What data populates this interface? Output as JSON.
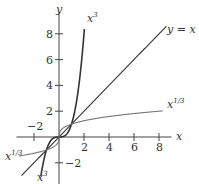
{
  "chart_data": {
    "type": "line",
    "title": "",
    "xlabel": "x",
    "ylabel": "y",
    "xlim": [
      -3.5,
      9.5
    ],
    "ylim": [
      -3.5,
      9.5
    ],
    "grid": false,
    "x_ticks": [
      -2,
      2,
      4,
      6,
      8
    ],
    "y_ticks": [
      -2,
      2,
      4,
      6,
      8
    ],
    "x_tick_labels": [
      "−2",
      "2",
      "4",
      "6",
      "8"
    ],
    "y_tick_labels": [
      "−2",
      "2",
      "4",
      "6",
      "8"
    ],
    "series": [
      {
        "name": "x^3",
        "label": "x",
        "label_sup": "3",
        "color": "#333333",
        "function": "x^3",
        "domain": [
          -1.45,
          2.03
        ]
      },
      {
        "name": "y = x",
        "label": "y = x",
        "color": "#333333",
        "function": "x",
        "domain": [
          -3,
          8.6
        ]
      },
      {
        "name": "x^1/3",
        "label": "x",
        "label_sup": "1/3",
        "color": "#777777",
        "function": "cbrt(x)",
        "domain": [
          -3.2,
          8.3
        ]
      }
    ],
    "annotations": [
      {
        "text": "x³",
        "position": "top, near (2, 8)"
      },
      {
        "text": "y = x",
        "position": "top right"
      },
      {
        "text": "x^1/3",
        "position": "right, near (8.5, 2)"
      },
      {
        "text": "x^1/3",
        "position": "left, near (-3.5, -1.5)"
      },
      {
        "text": "x³",
        "position": "bottom, near (-1.5, -3.3)"
      }
    ]
  },
  "axes": {
    "x_label": "x",
    "y_label": "y"
  },
  "labels": {
    "cube_top": "x",
    "cube_top_sup": "3",
    "identity": "y = x",
    "cbrt_right": "x",
    "cbrt_right_sup": "1/3",
    "cbrt_left": "x",
    "cbrt_left_sup": "1/3",
    "cube_bottom": "x",
    "cube_bottom_sup": "3"
  }
}
